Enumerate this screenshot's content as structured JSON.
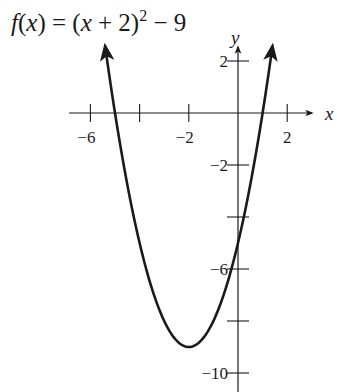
{
  "chart_data": {
    "type": "line",
    "title_parts": {
      "fx": "f",
      "open": "(",
      "var": "x",
      "close": ")",
      "eq": " = (",
      "var2": "x",
      "plus": " + 2)",
      "exp": "2",
      "minus": " − 9"
    },
    "function": "(x+2)^2 - 9",
    "xlabel": "x",
    "ylabel": "y",
    "xlim": [
      -6.5,
      3.0
    ],
    "ylim": [
      -10.9,
      3.8
    ],
    "x_ticks": [
      -6,
      -4,
      -2,
      2
    ],
    "x_tick_labels": [
      "−6",
      "",
      "−2",
      "2"
    ],
    "y_ticks": [
      2,
      -2,
      -4,
      -6,
      -8,
      -10
    ],
    "y_tick_labels": [
      "2",
      "−2",
      "",
      "−6",
      "",
      "−10"
    ],
    "vertex": [
      -2,
      -9
    ],
    "x_intercepts": [
      -5,
      1
    ],
    "y_intercept": -5,
    "curve_domain": [
      -5.4,
      1.4
    ],
    "grid": false,
    "legend": null,
    "x": [
      -5.4,
      -5,
      -4,
      -3,
      -2,
      -1,
      0,
      1,
      1.4
    ],
    "values": [
      2.56,
      0,
      -5,
      -8,
      -9,
      -8,
      -5,
      0,
      2.56
    ]
  },
  "style": {
    "ink": "#1a1a1a",
    "background": "#ffffff"
  }
}
